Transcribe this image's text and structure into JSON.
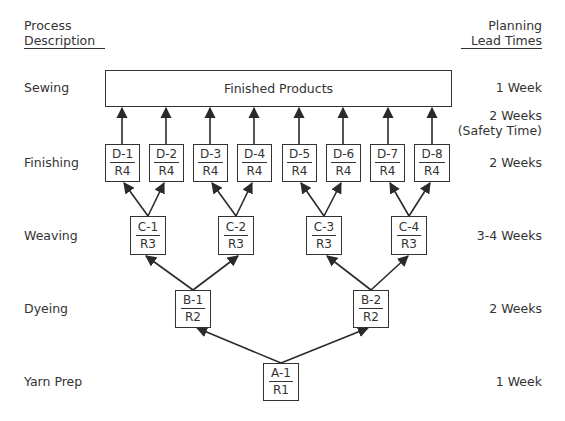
{
  "headers": {
    "left_line1": "Process",
    "left_line2": "Description",
    "right_line1": "Planning",
    "right_line2": "Lead Times"
  },
  "stages": [
    {
      "process": "Sewing",
      "lead_time": "1 Week"
    },
    {
      "process": "Finishing",
      "lead_time": "2 Weeks"
    },
    {
      "process": "Weaving",
      "lead_time": "3-4 Weeks"
    },
    {
      "process": "Dyeing",
      "lead_time": "2 Weeks"
    },
    {
      "process": "Yarn Prep",
      "lead_time": "1 Week"
    }
  ],
  "safety": {
    "line1": "2 Weeks",
    "line2": "(Safety Time)"
  },
  "finished_products": "Finished Products",
  "nodes": {
    "D": [
      {
        "id": "D-1",
        "resource": "R4"
      },
      {
        "id": "D-2",
        "resource": "R4"
      },
      {
        "id": "D-3",
        "resource": "R4"
      },
      {
        "id": "D-4",
        "resource": "R4"
      },
      {
        "id": "D-5",
        "resource": "R4"
      },
      {
        "id": "D-6",
        "resource": "R4"
      },
      {
        "id": "D-7",
        "resource": "R4"
      },
      {
        "id": "D-8",
        "resource": "R4"
      }
    ],
    "C": [
      {
        "id": "C-1",
        "resource": "R3"
      },
      {
        "id": "C-2",
        "resource": "R3"
      },
      {
        "id": "C-3",
        "resource": "R3"
      },
      {
        "id": "C-4",
        "resource": "R3"
      }
    ],
    "B": [
      {
        "id": "B-1",
        "resource": "R2"
      },
      {
        "id": "B-2",
        "resource": "R2"
      }
    ],
    "A": [
      {
        "id": "A-1",
        "resource": "R1"
      }
    ]
  },
  "colors": {
    "line": "#2a2a2a",
    "background": "#ffffff"
  }
}
